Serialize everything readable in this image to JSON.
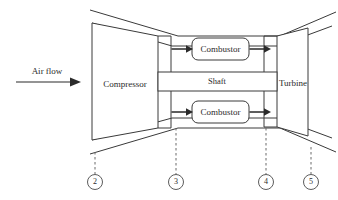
{
  "diagram": {
    "components": {
      "compressor": {
        "label": "Compressor",
        "name": "compressor-block"
      },
      "turbine": {
        "label": "Turbine",
        "name": "turbine-block"
      },
      "shaft": {
        "label": "Shaft",
        "name": "shaft-band"
      },
      "combustor_upper": {
        "label": "Combustor",
        "name": "combustor-upper"
      },
      "combustor_lower": {
        "label": "Combustor",
        "name": "combustor-lower"
      }
    },
    "inlet": {
      "label": "Air flow",
      "arrow_direction": "right"
    },
    "stations": [
      {
        "id": "2",
        "label": "2",
        "x": 95
      },
      {
        "id": "3",
        "label": "3",
        "x": 176
      },
      {
        "id": "4",
        "label": "4",
        "x": 266
      },
      {
        "id": "5",
        "label": "5",
        "x": 311
      }
    ],
    "flow_arrows": [
      {
        "name": "compressor-to-combustor-upper"
      },
      {
        "name": "compressor-to-combustor-lower"
      },
      {
        "name": "combustor-upper-to-turbine"
      },
      {
        "name": "combustor-lower-to-turbine"
      }
    ],
    "colors": {
      "line": "#3a3a3a",
      "text": "#2b2b2b",
      "dashed": "#6a6a6a",
      "background": "#ffffff"
    }
  }
}
